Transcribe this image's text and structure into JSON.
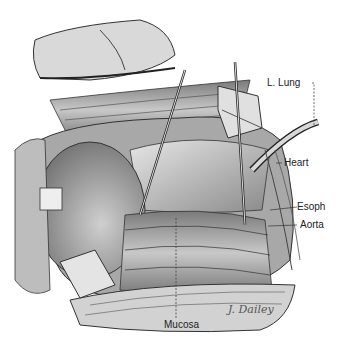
{
  "figure": {
    "labels": [
      {
        "id": "l_lung",
        "text": "L. Lung"
      },
      {
        "id": "heart",
        "text": "Heart"
      },
      {
        "id": "esoph",
        "text": "Esoph"
      },
      {
        "id": "aorta",
        "text": "Aorta"
      },
      {
        "id": "mucosa",
        "text": "Mucosa"
      }
    ],
    "signature": "J. Dailey"
  },
  "colors": {
    "background": "#ffffff",
    "ink": "#222222",
    "shade_dark": "#555555",
    "shade_mid": "#9a9a9a",
    "shade_light": "#d4d4d4"
  }
}
